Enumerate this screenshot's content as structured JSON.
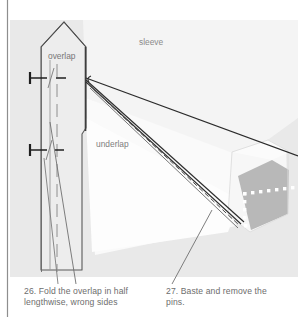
{
  "page": {
    "width": 298,
    "height": 317,
    "background": "#ffffff",
    "panel_color": "#e8e8e8",
    "fabric_light": "#f2f2f2",
    "fabric_white": "#fbfbfb",
    "fabric_shadow": "#b4b4b4",
    "ink": "#3a3a3a",
    "caption_color": "#6d6d6d",
    "stitch_color": "#ffffff"
  },
  "illustration": {
    "title": "sleeve placket overlap and underlap basting diagram",
    "labels": [
      {
        "id": "overlap",
        "text": "overlap",
        "x": 48,
        "y": 52
      },
      {
        "id": "sleeve",
        "text": "sleeve",
        "x": 139,
        "y": 38
      },
      {
        "id": "underlap",
        "text": "underlap",
        "x": 96,
        "y": 140
      }
    ],
    "icons": [
      {
        "name": "pin-icon",
        "x": 28,
        "y": 78
      },
      {
        "name": "pin-icon",
        "x": 28,
        "y": 150
      }
    ],
    "basting_stitches": {
      "name": "basting-stitch-dots",
      "horizontal_dots": 7,
      "vertical_dots": 7
    }
  },
  "captions": [
    {
      "id": "caption-26",
      "number": "26.",
      "text": "26. Fold the overlap in half\nlengthwise, wrong sides"
    },
    {
      "id": "caption-27",
      "number": "27.",
      "text": "27. Baste and remove the\npins."
    }
  ]
}
